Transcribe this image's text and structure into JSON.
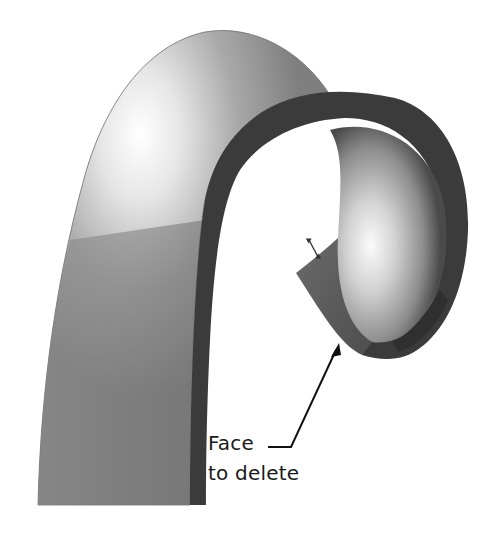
{
  "figure": {
    "annotation": {
      "line1": "Face",
      "line2": "to delete",
      "target": "end face of curled sheet"
    },
    "colors": {
      "background": "#ffffff",
      "outer_surface": "#8a8a8a",
      "highlight": "#f2f2f2",
      "thickness_edge": "#3a3a3a",
      "inner_surface": "#b8b8b8",
      "arrow": "#111111",
      "text": "#1a1a1a"
    }
  }
}
